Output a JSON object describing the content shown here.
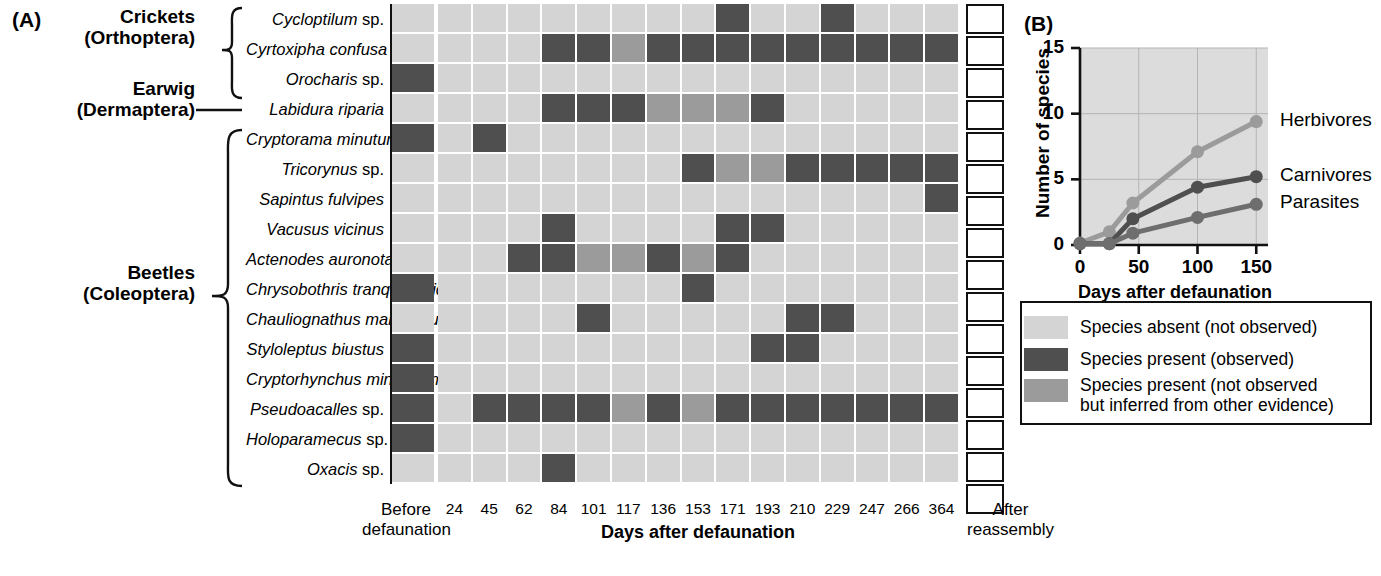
{
  "panel_a": {
    "letter": "(A)",
    "groups": [
      {
        "name": "crickets",
        "label": "Crickets\n(Orthoptera)",
        "line1": "Crickets",
        "line2": "(Orthoptera)"
      },
      {
        "name": "earwig",
        "label": "Earwig\n(Dermaptera)",
        "line1": "Earwig",
        "line2": "(Dermaptera)"
      },
      {
        "name": "beetles",
        "label": "Beetles\n(Coleoptera)",
        "line1": "Beetles",
        "line2": "(Coleoptera)"
      }
    ],
    "species": [
      {
        "genus": "Cycloptilum",
        "epithet": "sp."
      },
      {
        "genus": "Cyrtoxipha",
        "epithet": "confusa"
      },
      {
        "genus": "Orocharis",
        "epithet": "sp."
      },
      {
        "genus": "Labidura",
        "epithet": "riparia"
      },
      {
        "genus": "Cryptorama",
        "epithet": "minutum"
      },
      {
        "genus": "Tricorynus",
        "epithet": "sp."
      },
      {
        "genus": "Sapintus",
        "epithet": "fulvipes"
      },
      {
        "genus": "Vacusus",
        "epithet": "vicinus"
      },
      {
        "genus": "Actenodes",
        "epithet": "auronotata"
      },
      {
        "genus": "Chrysobothris",
        "epithet": "tranquebarica"
      },
      {
        "genus": "Chauliognathus",
        "epithet": "marginatus"
      },
      {
        "genus": "Styloleptus",
        "epithet": "biustus"
      },
      {
        "genus": "Cryptorhynchus",
        "epithet": "minutissimus"
      },
      {
        "genus": "Pseudoacalles",
        "epithet": "sp."
      },
      {
        "genus": "Holoparamecus",
        "epithet": "sp."
      },
      {
        "genus": "Oxacis",
        "epithet": "sp."
      }
    ],
    "before_label_line1": "Before",
    "before_label_line2": "defaunation",
    "after_label_line1": "After",
    "after_label_line2": "reassembly",
    "x_axis_title": "Days after defaunation",
    "day_ticks": [
      "24",
      "45",
      "62",
      "84",
      "101",
      "117",
      "136",
      "153",
      "171",
      "193",
      "210",
      "229",
      "247",
      "266",
      "364"
    ],
    "before_defaunation": [
      "absent",
      "absent",
      "present",
      "absent",
      "present",
      "absent",
      "absent",
      "absent",
      "absent",
      "present",
      "absent",
      "present",
      "present",
      "present",
      "present",
      "absent"
    ],
    "matrix": [
      [
        "absent",
        "absent",
        "absent",
        "absent",
        "absent",
        "absent",
        "absent",
        "absent",
        "present",
        "absent",
        "absent",
        "present",
        "absent",
        "absent",
        "absent"
      ],
      [
        "absent",
        "absent",
        "absent",
        "present",
        "present",
        "inferred",
        "present",
        "present",
        "present",
        "present",
        "present",
        "present",
        "present",
        "present",
        "present"
      ],
      [
        "absent",
        "absent",
        "absent",
        "absent",
        "absent",
        "absent",
        "absent",
        "absent",
        "absent",
        "absent",
        "absent",
        "absent",
        "absent",
        "absent",
        "absent"
      ],
      [
        "absent",
        "absent",
        "absent",
        "present",
        "present",
        "present",
        "inferred",
        "inferred",
        "inferred",
        "present",
        "absent",
        "absent",
        "absent",
        "absent",
        "absent"
      ],
      [
        "absent",
        "present",
        "absent",
        "absent",
        "absent",
        "absent",
        "absent",
        "absent",
        "absent",
        "absent",
        "absent",
        "absent",
        "absent",
        "absent",
        "absent"
      ],
      [
        "absent",
        "absent",
        "absent",
        "absent",
        "absent",
        "absent",
        "absent",
        "present",
        "inferred",
        "inferred",
        "present",
        "present",
        "present",
        "present",
        "present"
      ],
      [
        "absent",
        "absent",
        "absent",
        "absent",
        "absent",
        "absent",
        "absent",
        "absent",
        "absent",
        "absent",
        "absent",
        "absent",
        "absent",
        "absent",
        "present"
      ],
      [
        "absent",
        "absent",
        "absent",
        "present",
        "absent",
        "absent",
        "absent",
        "absent",
        "present",
        "present",
        "absent",
        "absent",
        "absent",
        "absent",
        "absent"
      ],
      [
        "absent",
        "absent",
        "present",
        "present",
        "inferred",
        "inferred",
        "present",
        "inferred",
        "present",
        "absent",
        "absent",
        "absent",
        "absent",
        "absent",
        "absent"
      ],
      [
        "absent",
        "absent",
        "absent",
        "absent",
        "absent",
        "absent",
        "absent",
        "present",
        "absent",
        "absent",
        "absent",
        "absent",
        "absent",
        "absent",
        "absent"
      ],
      [
        "absent",
        "absent",
        "absent",
        "absent",
        "present",
        "absent",
        "absent",
        "absent",
        "absent",
        "absent",
        "present",
        "present",
        "absent",
        "absent",
        "absent"
      ],
      [
        "absent",
        "absent",
        "absent",
        "absent",
        "absent",
        "absent",
        "absent",
        "absent",
        "absent",
        "present",
        "present",
        "absent",
        "absent",
        "absent",
        "absent"
      ],
      [
        "absent",
        "absent",
        "absent",
        "absent",
        "absent",
        "absent",
        "absent",
        "absent",
        "absent",
        "absent",
        "absent",
        "absent",
        "absent",
        "absent",
        "absent"
      ],
      [
        "absent",
        "present",
        "present",
        "present",
        "present",
        "inferred",
        "present",
        "inferred",
        "present",
        "present",
        "present",
        "present",
        "present",
        "present",
        "present"
      ],
      [
        "absent",
        "absent",
        "absent",
        "absent",
        "absent",
        "absent",
        "absent",
        "absent",
        "absent",
        "absent",
        "absent",
        "absent",
        "absent",
        "absent",
        "absent"
      ],
      [
        "absent",
        "absent",
        "absent",
        "present",
        "absent",
        "absent",
        "absent",
        "absent",
        "absent",
        "absent",
        "absent",
        "absent",
        "absent",
        "absent",
        "absent"
      ]
    ],
    "after_reassembly": [
      "empty",
      "empty",
      "empty",
      "empty",
      "empty",
      "empty",
      "empty",
      "empty",
      "empty",
      "empty",
      "empty",
      "empty",
      "empty",
      "empty",
      "empty",
      "empty"
    ]
  },
  "panel_b": {
    "letter": "(B)"
  },
  "chart_data": {
    "type": "line",
    "title": "",
    "xlabel": "Days after defaunation",
    "ylabel": "Number of species",
    "xlim": [
      0,
      160
    ],
    "ylim": [
      0,
      15
    ],
    "xticks": [
      0,
      50,
      100,
      150
    ],
    "xticklabels": [
      "0",
      "50",
      "100",
      "150"
    ],
    "yticks": [
      0,
      5,
      10,
      15
    ],
    "yticklabels": [
      "0",
      "5",
      "10",
      "15"
    ],
    "grid": true,
    "legend_position": "right-of-line-ends",
    "x": [
      0,
      25,
      45,
      100,
      150
    ],
    "series": [
      {
        "name": "Herbivores",
        "values": [
          0.15,
          1.0,
          3.2,
          7.1,
          9.4
        ],
        "color": "#9b9b9b"
      },
      {
        "name": "Carnivores",
        "values": [
          0.1,
          0.1,
          2.0,
          4.4,
          5.2
        ],
        "color": "#4f4f4f"
      },
      {
        "name": "Parasites",
        "values": [
          0.1,
          0.1,
          0.9,
          2.1,
          3.1
        ],
        "color": "#6e6e6e"
      }
    ]
  },
  "legend": {
    "items": [
      {
        "swatch": "absent",
        "color": "#d4d4d4",
        "text": "Species absent (not observed)"
      },
      {
        "swatch": "present",
        "color": "#4f4f4f",
        "text": "Species present (observed)"
      },
      {
        "swatch": "inferred",
        "color": "#9b9b9b",
        "text": "Species present (not observed\nbut inferred from other evidence)"
      }
    ],
    "inferred_line1": "Species present (not observed",
    "inferred_line2": "but inferred from other evidence)"
  }
}
